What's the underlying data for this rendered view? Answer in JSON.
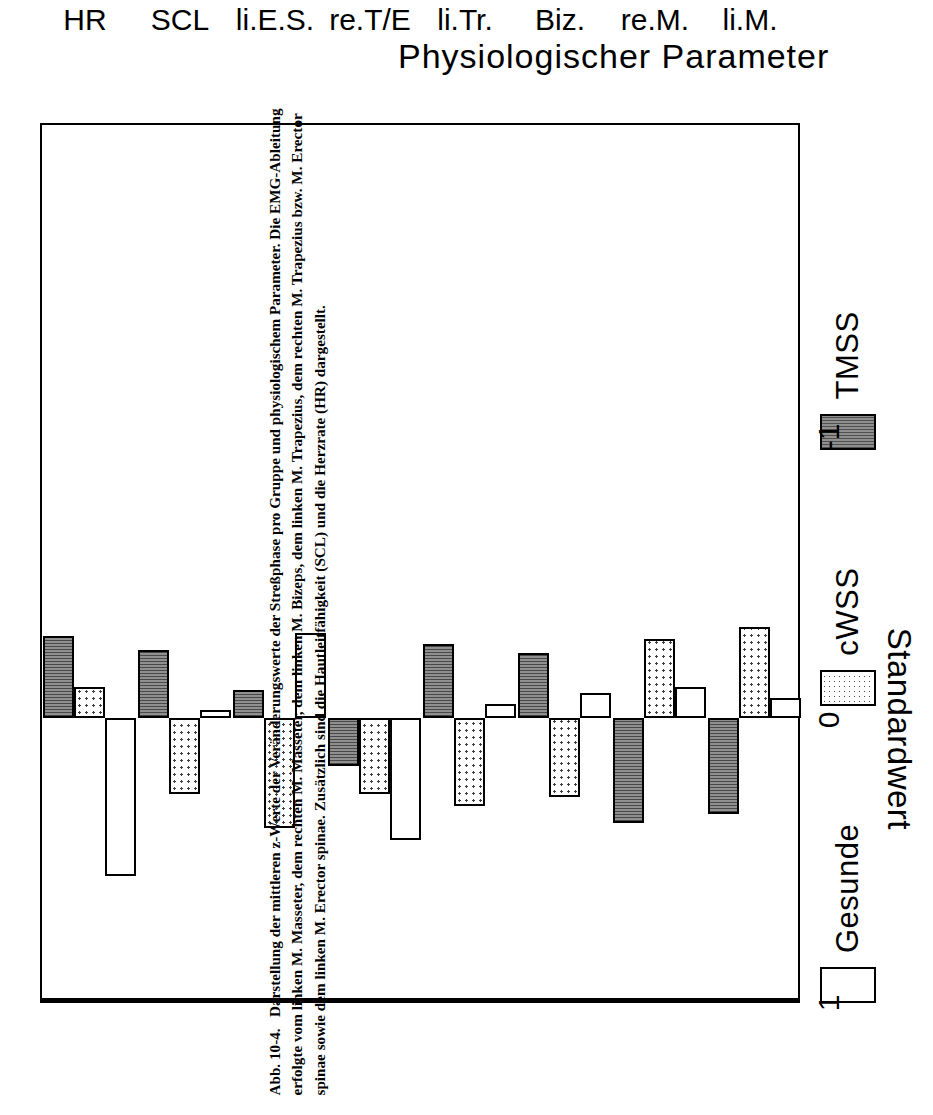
{
  "figure": {
    "number": "Abb. 10-4.",
    "caption_lines": [
      "Darstellung der mittleren z-Werte der Veränderungswerte der Streßphase pro Gruppe",
      "und physiologischem Parameter.  Die EMG-Ableitung erfolgte vom linken M. Masseter, dem rechten",
      "M. Masseter, dem linken M. Bizeps, dem linken M. Trapezius, dem rechten M. Trapezius bzw. M.",
      "Erector spinae sowie dem linken M. Erector spinae.  Zusätzlich sind die Hautleitfähigkeit (SCL) und",
      "die Herzrate (HR) dargestellt."
    ]
  },
  "legend": {
    "items": [
      {
        "label": "Gesunde",
        "pattern": "empty",
        "swatch_name": "legend-swatch-gesunde"
      },
      {
        "label": "cWSS",
        "pattern": "dotted",
        "swatch_name": "legend-swatch-cwss"
      },
      {
        "label": "TMSS",
        "pattern": "hatched",
        "swatch_name": "legend-swatch-tmss"
      }
    ]
  },
  "axes": {
    "x_title": "Physiologischer Parameter",
    "y_title": "Standardwert",
    "y_ticks": [
      "1",
      "0",
      "-1"
    ]
  },
  "chart_data": {
    "type": "bar",
    "title": "",
    "xlabel": "Physiologischer Parameter",
    "ylabel": "Standardwert",
    "ylim": [
      -1,
      1
    ],
    "y_ticks": [
      1,
      0,
      -1
    ],
    "grid": false,
    "orientation": "vertical-grouped",
    "legend_position": "top-left",
    "categories": [
      "li.M.",
      "re.M.",
      "Biz.",
      "li.Tr.",
      "re.T/E",
      "li.E.S.",
      "SCL",
      "HR"
    ],
    "series": [
      {
        "name": "Gesunde",
        "pattern": "empty",
        "values": [
          -0.07,
          -0.11,
          -0.09,
          -0.05,
          0.43,
          -0.3,
          -0.03,
          0.56
        ]
      },
      {
        "name": "cWSS",
        "pattern": "dotted",
        "values": [
          -0.32,
          -0.28,
          0.28,
          0.31,
          0.27,
          0.39,
          0.27,
          -0.11
        ]
      },
      {
        "name": "TMSS",
        "pattern": "hatched",
        "values": [
          0.34,
          0.37,
          -0.23,
          -0.26,
          0.17,
          -0.1,
          -0.24,
          -0.29
        ]
      }
    ]
  }
}
